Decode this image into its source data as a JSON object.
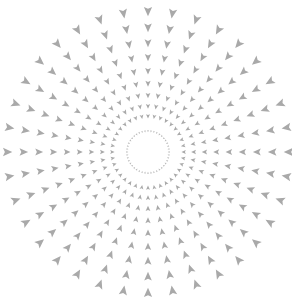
{
  "artwork": {
    "title": "Radial arrowhead burst",
    "description": "Concentric radial pattern of gray arrowheads pointing toward the center",
    "spoke_count": 36,
    "arrows_per_spoke": 9,
    "inner_ring_count": 44,
    "colors": {
      "background": "#ffffff",
      "arrow": "#a9a9a9",
      "inner_ring": "#b4b4b4"
    }
  }
}
